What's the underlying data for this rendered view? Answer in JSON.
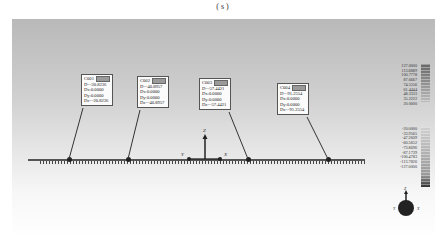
{
  "caption": "( s )",
  "callouts": [
    {
      "id": "C001",
      "D": "D=-20.8236",
      "Dx": "Dx:0.0000",
      "Dy": "Dy:0.0000",
      "Dz": "Dz=-20.8236"
    },
    {
      "id": "C002",
      "D": "D=-40.8957",
      "Dx": "Dx:0.0000",
      "Dy": "Dy:0.0000",
      "Dz": "Dz=-40.8957"
    },
    {
      "id": "C003",
      "D": "D=-57.4421",
      "Dx": "Dx:0.0000",
      "Dy": "Dy:0.0000",
      "Dz": "Dz=-57.4421"
    },
    {
      "id": "C004",
      "D": "D=-91.2554",
      "Dx": "Dx:0.0000",
      "Dy": "Dy:0.0000",
      "Dz": "Dz=-91.2554"
    }
  ],
  "axes": {
    "z": "Z",
    "y": "Y",
    "x": "X"
  },
  "legend": {
    "upper": [
      "127.0000",
      "113.8889",
      "100.7778",
      "87.6667",
      "74.5556",
      "61.4444",
      "48.3333",
      "35.2222",
      "20.0000"
    ],
    "lower": [
      "-20.0000",
      "-33.9565",
      "-47.2609",
      "-60.5652",
      "-73.8696",
      "-87.1739",
      "-100.4783",
      "-113.7826",
      "-127.0000"
    ]
  },
  "triad": {
    "z": "Z",
    "left": "Y",
    "right": "X"
  }
}
